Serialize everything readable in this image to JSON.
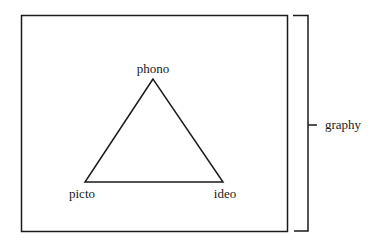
{
  "diagram": {
    "vertices": {
      "top": "phono",
      "left": "picto",
      "right": "ideo"
    },
    "bracket_label": "graphy",
    "colors": {
      "stroke": "#1a1a1a",
      "background": "#ffffff"
    }
  }
}
